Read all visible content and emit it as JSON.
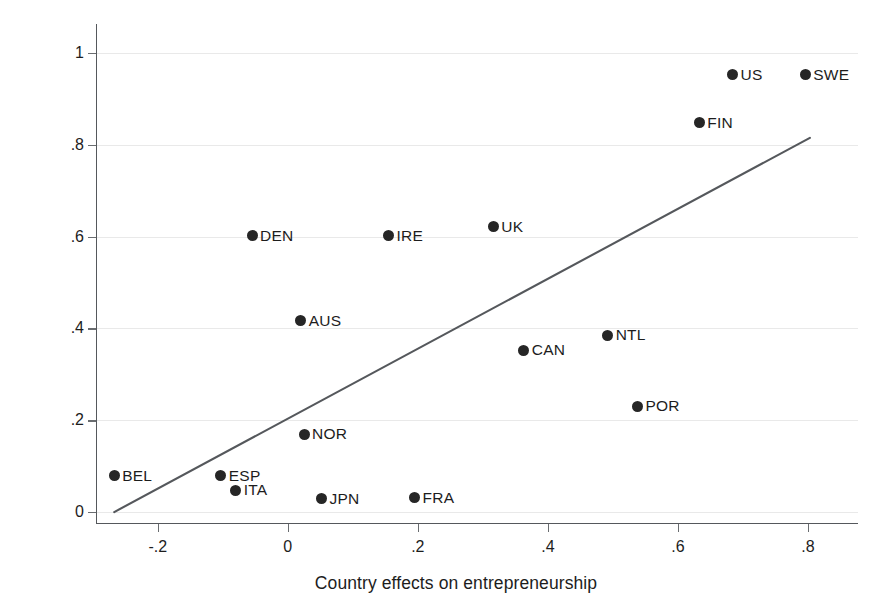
{
  "chart_data": {
    "type": "scatter",
    "title": "",
    "xlabel": "Country effects on entrepreneurship",
    "ylabel": "Annual average TFP growth for 1993-2013",
    "xlim": [
      -0.295,
      0.877
    ],
    "ylim": [
      -0.026,
      1.063
    ],
    "xticks": [
      -0.2,
      0,
      0.2,
      0.4,
      0.6,
      0.8
    ],
    "xtick_labels": [
      "-.2",
      "0",
      ".2",
      ".4",
      ".6",
      ".8"
    ],
    "yticks": [
      0,
      0.2,
      0.4,
      0.6,
      0.8,
      1
    ],
    "ytick_labels": [
      "0",
      ".2",
      ".4",
      ".6",
      ".8",
      "1"
    ],
    "grid": "horizontal",
    "legend": "none",
    "marker_color": "#262626",
    "line_color": "#55585c",
    "grid_color": "#e9e9e9",
    "points": [
      {
        "label": "BEL",
        "x": -0.267,
        "y": 0.079
      },
      {
        "label": "ESP",
        "x": -0.103,
        "y": 0.079
      },
      {
        "label": "ITA",
        "x": -0.08,
        "y": 0.048
      },
      {
        "label": "DEN",
        "x": -0.055,
        "y": 0.602
      },
      {
        "label": "AUS",
        "x": 0.02,
        "y": 0.417
      },
      {
        "label": "NOR",
        "x": 0.025,
        "y": 0.169
      },
      {
        "label": "JPN",
        "x": 0.052,
        "y": 0.029
      },
      {
        "label": "IRE",
        "x": 0.155,
        "y": 0.602
      },
      {
        "label": "FRA",
        "x": 0.195,
        "y": 0.031
      },
      {
        "label": "UK",
        "x": 0.316,
        "y": 0.621
      },
      {
        "label": "CAN",
        "x": 0.363,
        "y": 0.352
      },
      {
        "label": "NTL",
        "x": 0.492,
        "y": 0.385
      },
      {
        "label": "POR",
        "x": 0.538,
        "y": 0.231
      },
      {
        "label": "FIN",
        "x": 0.633,
        "y": 0.848
      },
      {
        "label": "US",
        "x": 0.684,
        "y": 0.952
      },
      {
        "label": "SWE",
        "x": 0.796,
        "y": 0.952
      }
    ],
    "fit_line": {
      "name": "linear fit",
      "x_start": -0.267,
      "y_start": 0.0,
      "x_end": 0.803,
      "y_end": 0.815
    }
  }
}
